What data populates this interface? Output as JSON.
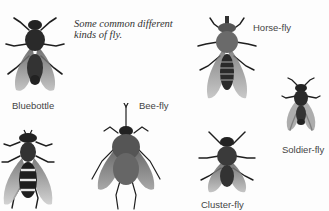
{
  "caption": "Some common different kinds of fly.",
  "flies": [
    {
      "id": "bluebottle",
      "label": "Bluebottle"
    },
    {
      "id": "horse-fly",
      "label": "Horse-fly"
    },
    {
      "id": "bee-fly",
      "label": "Bee-fly"
    },
    {
      "id": "soldier-fly",
      "label": "Soldier-fly"
    },
    {
      "id": "cluster-fly",
      "label": "Cluster-fly"
    },
    {
      "id": "hover-fly",
      "label": ""
    }
  ],
  "colors": {
    "ink": "#1e1e1e",
    "wing": "#8a8a8a",
    "label": "#444444"
  }
}
